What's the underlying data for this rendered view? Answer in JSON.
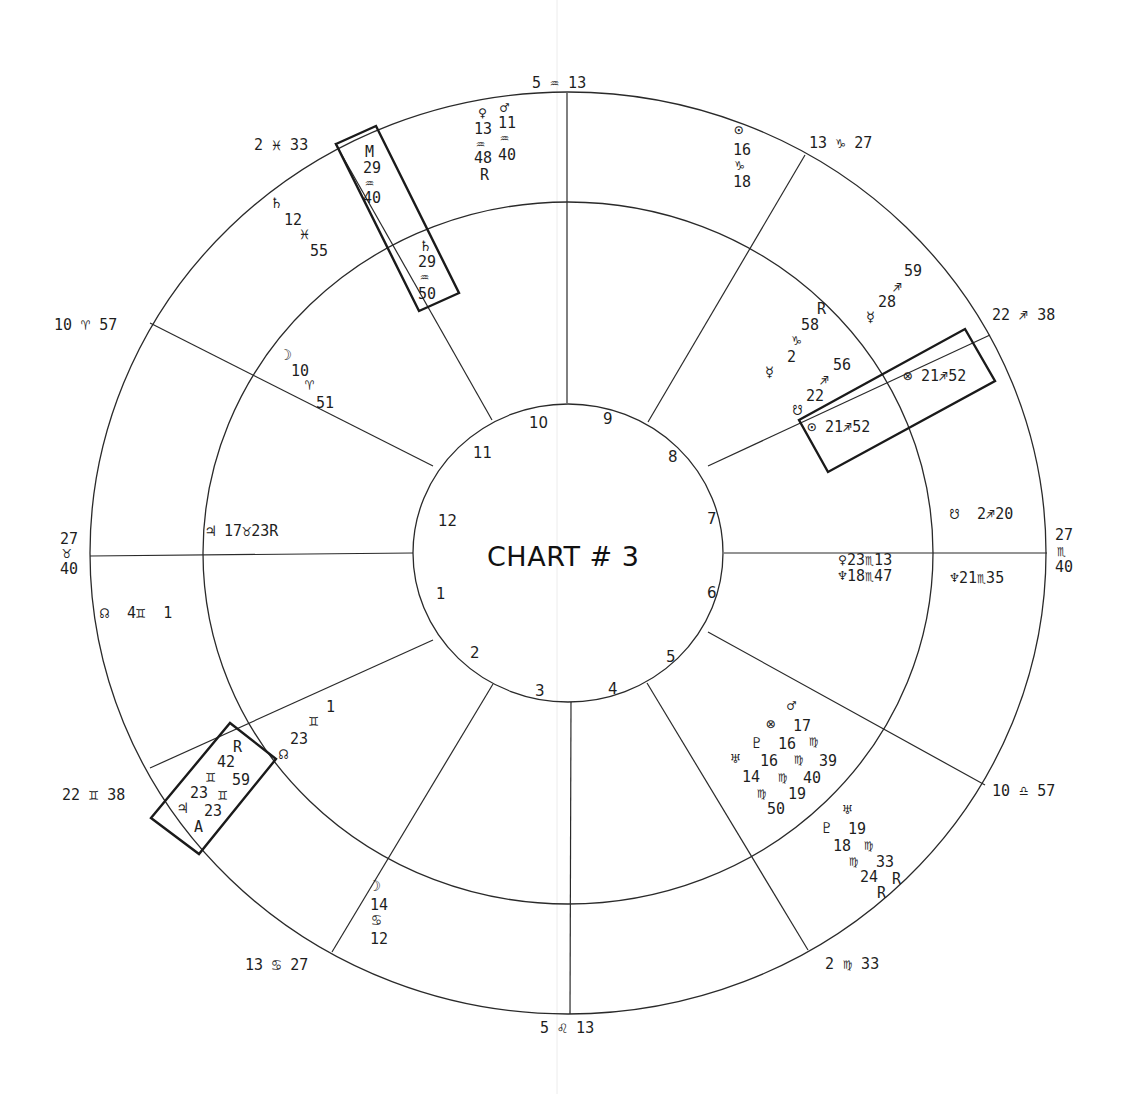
{
  "title": "CHART # 3",
  "geometry": {
    "center": [
      568,
      553
    ],
    "outer": [
      478,
      461
    ],
    "middle": [
      365,
      351
    ],
    "inner": [
      155,
      149
    ]
  },
  "cusp_lines": [
    {
      "from": [
        567,
        403
      ],
      "to": [
        567,
        93
      ]
    },
    {
      "from": [
        648,
        422
      ],
      "to": [
        805,
        155
      ]
    },
    {
      "from": [
        708,
        466
      ],
      "to": [
        990,
        335
      ]
    },
    {
      "from": [
        724,
        553
      ],
      "to": [
        1047,
        553
      ]
    },
    {
      "from": [
        708,
        632
      ],
      "to": [
        985,
        785
      ]
    },
    {
      "from": [
        647,
        683
      ],
      "to": [
        808,
        950
      ]
    },
    {
      "from": [
        571,
        702
      ],
      "to": [
        570,
        1014
      ]
    },
    {
      "from": [
        493,
        684
      ],
      "to": [
        332,
        952
      ]
    },
    {
      "from": [
        433,
        640
      ],
      "to": [
        150,
        768
      ]
    },
    {
      "from": [
        413,
        553
      ],
      "to": [
        90,
        556
      ]
    },
    {
      "from": [
        433,
        466
      ],
      "to": [
        150,
        323
      ]
    },
    {
      "from": [
        492,
        420
      ],
      "to": [
        335,
        143
      ]
    }
  ],
  "house_numbers": [
    {
      "label": "1",
      "x": 436,
      "y": 599
    },
    {
      "label": "2",
      "x": 470,
      "y": 658
    },
    {
      "label": "3",
      "x": 535,
      "y": 696
    },
    {
      "label": "4",
      "x": 608,
      "y": 694
    },
    {
      "label": "5",
      "x": 666,
      "y": 662
    },
    {
      "label": "6",
      "x": 707,
      "y": 598
    },
    {
      "label": "7",
      "x": 707,
      "y": 524
    },
    {
      "label": "8",
      "x": 668,
      "y": 462
    },
    {
      "label": "9",
      "x": 603,
      "y": 424
    },
    {
      "label": "10",
      "x": 529,
      "y": 428
    },
    {
      "label": "11",
      "x": 473,
      "y": 458
    },
    {
      "label": "12",
      "x": 438,
      "y": 526
    }
  ],
  "cusp_labels": [
    {
      "name": "cusp-mc",
      "text": "5 ♒ 13",
      "x": 532,
      "y": 88
    },
    {
      "name": "cusp-11",
      "text": "13 ♑ 27",
      "x": 809,
      "y": 148
    },
    {
      "name": "cusp-12",
      "text": "22 ♐ 38",
      "x": 992,
      "y": 320
    },
    {
      "name": "cusp-asc-deg",
      "text": "27",
      "x": 1055,
      "y": 540
    },
    {
      "name": "cusp-asc-sign",
      "text": "♏",
      "x": 1057,
      "y": 556
    },
    {
      "name": "cusp-asc-min",
      "text": "40",
      "x": 1055,
      "y": 572
    },
    {
      "name": "cusp-2",
      "text": "10 ♎ 57",
      "x": 992,
      "y": 796
    },
    {
      "name": "cusp-3",
      "text": "2 ♍ 33",
      "x": 825,
      "y": 969
    },
    {
      "name": "cusp-ic",
      "text": "5 ♌ 13",
      "x": 540,
      "y": 1033
    },
    {
      "name": "cusp-5",
      "text": "13 ♋ 27",
      "x": 245,
      "y": 970
    },
    {
      "name": "cusp-6",
      "text": "22 ♊ 38",
      "x": 62,
      "y": 800
    },
    {
      "name": "cusp-desc-deg",
      "text": "27",
      "x": 60,
      "y": 544
    },
    {
      "name": "cusp-desc-sign",
      "text": "♉",
      "x": 62,
      "y": 558
    },
    {
      "name": "cusp-desc-min",
      "text": "40",
      "x": 60,
      "y": 574
    },
    {
      "name": "cusp-8",
      "text": "10 ♈ 57",
      "x": 54,
      "y": 330
    },
    {
      "name": "cusp-9",
      "text": "2 ♓ 33",
      "x": 254,
      "y": 150
    }
  ],
  "planet_labels": [
    {
      "name": "venus-glyph",
      "text": "♀",
      "x": 478,
      "y": 118
    },
    {
      "name": "venus-deg",
      "text": "13",
      "x": 474,
      "y": 134
    },
    {
      "name": "venus-sign",
      "text": "♒",
      "x": 476,
      "y": 149
    },
    {
      "name": "venus-min",
      "text": "48",
      "x": 474,
      "y": 163
    },
    {
      "name": "venus-retro",
      "text": "R",
      "x": 480,
      "y": 180
    },
    {
      "name": "mars-glyph",
      "text": "♂",
      "x": 500,
      "y": 113
    },
    {
      "name": "mars-deg",
      "text": "11",
      "x": 498,
      "y": 128
    },
    {
      "name": "mars-sign",
      "text": "♒",
      "x": 500,
      "y": 143
    },
    {
      "name": "mars-min",
      "text": "40",
      "x": 498,
      "y": 160
    },
    {
      "name": "mc-point-glyph",
      "text": "M",
      "x": 365,
      "y": 157
    },
    {
      "name": "mc-point-deg",
      "text": "29",
      "x": 363,
      "y": 173
    },
    {
      "name": "mc-point-sign",
      "text": "♒",
      "x": 365,
      "y": 188
    },
    {
      "name": "mc-point-min",
      "text": "40",
      "x": 363,
      "y": 203
    },
    {
      "name": "saturn-inner-glyph",
      "text": "♄",
      "x": 421,
      "y": 251
    },
    {
      "name": "saturn-inner-deg",
      "text": "29",
      "x": 418,
      "y": 267
    },
    {
      "name": "saturn-inner-sign",
      "text": "♒",
      "x": 420,
      "y": 282
    },
    {
      "name": "saturn-inner-min",
      "text": "50",
      "x": 418,
      "y": 299
    },
    {
      "name": "saturn-outer-glyph",
      "text": "♄",
      "x": 272,
      "y": 208
    },
    {
      "name": "saturn-outer-deg",
      "text": "12",
      "x": 284,
      "y": 225
    },
    {
      "name": "saturn-outer-sign",
      "text": "♓",
      "x": 300,
      "y": 239
    },
    {
      "name": "saturn-outer-min",
      "text": "55",
      "x": 310,
      "y": 256
    },
    {
      "name": "sun-outer-glyph",
      "text": "⊙",
      "x": 734,
      "y": 135
    },
    {
      "name": "sun-outer-deg",
      "text": "16",
      "x": 733,
      "y": 155
    },
    {
      "name": "sun-outer-sign",
      "text": "♑",
      "x": 735,
      "y": 170
    },
    {
      "name": "sun-outer-min",
      "text": "18",
      "x": 733,
      "y": 187
    },
    {
      "name": "mercury-outer-min",
      "text": "59",
      "x": 904,
      "y": 276
    },
    {
      "name": "mercury-outer-sign",
      "text": "♐",
      "x": 893,
      "y": 292
    },
    {
      "name": "mercury-outer-deg",
      "text": "28",
      "x": 878,
      "y": 307
    },
    {
      "name": "mercury-outer-glyph",
      "text": "☿",
      "x": 866,
      "y": 322
    },
    {
      "name": "mercury-inner-retro",
      "text": "R",
      "x": 817,
      "y": 314
    },
    {
      "name": "mercury-inner-min",
      "text": "58",
      "x": 801,
      "y": 330
    },
    {
      "name": "mercury-inner-sign",
      "text": "♑",
      "x": 792,
      "y": 345
    },
    {
      "name": "mercury-inner-deg",
      "text": "2",
      "x": 787,
      "y": 362
    },
    {
      "name": "mercury-inner-glyph",
      "text": "☿",
      "x": 765,
      "y": 377
    },
    {
      "name": "node-inner-min",
      "text": "56",
      "x": 833,
      "y": 370
    },
    {
      "name": "node-inner-sign",
      "text": "♐",
      "x": 820,
      "y": 385
    },
    {
      "name": "node-inner-deg",
      "text": "22",
      "x": 806,
      "y": 401
    },
    {
      "name": "node-inner-glyph",
      "text": "☋",
      "x": 793,
      "y": 415
    },
    {
      "name": "part-fortune-outer",
      "text": "⊗ 21♐52",
      "x": 903,
      "y": 381
    },
    {
      "name": "sun-inner",
      "text": "⊙ 21♐52",
      "x": 807,
      "y": 432
    },
    {
      "name": "south-node-outer",
      "text": "☋  2♐20",
      "x": 950,
      "y": 519
    },
    {
      "name": "venus-inner",
      "text": "♀23♏13",
      "x": 838,
      "y": 565
    },
    {
      "name": "neptune-inner",
      "text": "♆18♏47",
      "x": 838,
      "y": 581
    },
    {
      "name": "neptune-outer",
      "text": "♆21♏35",
      "x": 950,
      "y": 583
    },
    {
      "name": "moon-inner-glyph",
      "text": "☽",
      "x": 283,
      "y": 360
    },
    {
      "name": "moon-inner-deg",
      "text": "10",
      "x": 291,
      "y": 376
    },
    {
      "name": "moon-inner-sign",
      "text": "♈",
      "x": 305,
      "y": 390
    },
    {
      "name": "moon-inner-min",
      "text": "51",
      "x": 316,
      "y": 408
    },
    {
      "name": "jupiter-inner",
      "text": "♃ 17♉23R",
      "x": 206,
      "y": 536
    },
    {
      "name": "north-node-outer",
      "text": "☊  4♊  1",
      "x": 100,
      "y": 618
    },
    {
      "name": "north-node-inner-min",
      "text": "1",
      "x": 326,
      "y": 712
    },
    {
      "name": "north-node-inner-sign",
      "text": "♊",
      "x": 309,
      "y": 726
    },
    {
      "name": "north-node-inner-deg",
      "text": "23",
      "x": 290,
      "y": 744
    },
    {
      "name": "north-node-inner-glyph",
      "text": "☊",
      "x": 279,
      "y": 759
    },
    {
      "name": "jupiter-outer-retro",
      "text": "R",
      "x": 233,
      "y": 752
    },
    {
      "name": "jupiter-outer-min",
      "text": "42",
      "x": 217,
      "y": 767
    },
    {
      "name": "jupiter-outer-sign",
      "text": "♊",
      "x": 206,
      "y": 782
    },
    {
      "name": "jupiter-outer-min2",
      "text": "59",
      "x": 232,
      "y": 785
    },
    {
      "name": "asc-point-deg",
      "text": "23",
      "x": 190,
      "y": 798
    },
    {
      "name": "asc-point-sign",
      "text": "♊",
      "x": 218,
      "y": 800
    },
    {
      "name": "jupiter-outer-glyph",
      "text": "♃",
      "x": 178,
      "y": 813
    },
    {
      "name": "jupiter-outer-deg",
      "text": "23",
      "x": 204,
      "y": 816
    },
    {
      "name": "asc-point-glyph",
      "text": "A",
      "x": 194,
      "y": 832
    },
    {
      "name": "moon-outer-glyph",
      "text": "☽",
      "x": 372,
      "y": 891
    },
    {
      "name": "moon-outer-deg",
      "text": "14",
      "x": 370,
      "y": 910
    },
    {
      "name": "moon-outer-sign",
      "text": "♋",
      "x": 372,
      "y": 925
    },
    {
      "name": "moon-outer-min",
      "text": "12",
      "x": 370,
      "y": 944
    },
    {
      "name": "mars-lower-glyph",
      "text": "♂",
      "x": 787,
      "y": 711
    },
    {
      "name": "fortune-lower-glyph",
      "text": "⊗",
      "x": 766,
      "y": 729
    },
    {
      "name": "mars-lower-deg",
      "text": "17",
      "x": 793,
      "y": 731
    },
    {
      "name": "pluto-lower-glyph",
      "text": "♇",
      "x": 752,
      "y": 748
    },
    {
      "name": "pluto-lower-deg",
      "text": "16",
      "x": 778,
      "y": 749
    },
    {
      "name": "mars-lower-sign",
      "text": "♍",
      "x": 809,
      "y": 746
    },
    {
      "name": "uranus-lower-glyph",
      "text": "♅",
      "x": 731,
      "y": 764
    },
    {
      "name": "uranus-lower-deg",
      "text": "16",
      "x": 760,
      "y": 766
    },
    {
      "name": "pluto-lower-sign",
      "text": "♍",
      "x": 794,
      "y": 764
    },
    {
      "name": "mars-lower-min",
      "text": "39",
      "x": 819,
      "y": 766
    },
    {
      "name": "uranus-lower-min-row",
      "text": "14",
      "x": 742,
      "y": 782
    },
    {
      "name": "uranus-lower-sign",
      "text": "♍",
      "x": 778,
      "y": 782
    },
    {
      "name": "pluto-lower-min",
      "text": "40",
      "x": 803,
      "y": 783
    },
    {
      "name": "fortune-lower-sign",
      "text": "♍",
      "x": 757,
      "y": 798
    },
    {
      "name": "fortune-lower-deg",
      "text": "19",
      "x": 788,
      "y": 799
    },
    {
      "name": "fortune-lower-min",
      "text": "50",
      "x": 767,
      "y": 814
    },
    {
      "name": "uranus-outer-glyph",
      "text": "♅",
      "x": 843,
      "y": 815
    },
    {
      "name": "pluto-outer-glyph",
      "text": "♇",
      "x": 822,
      "y": 833
    },
    {
      "name": "uranus-outer-deg",
      "text": "19",
      "x": 848,
      "y": 834
    },
    {
      "name": "pluto-outer-deg",
      "text": "18",
      "x": 833,
      "y": 851
    },
    {
      "name": "uranus-outer-sign",
      "text": "♍",
      "x": 864,
      "y": 850
    },
    {
      "name": "pluto-outer-sign",
      "text": "♍",
      "x": 849,
      "y": 866
    },
    {
      "name": "uranus-outer-min",
      "text": "33",
      "x": 876,
      "y": 867
    },
    {
      "name": "pluto-outer-min",
      "text": "24",
      "x": 860,
      "y": 882
    },
    {
      "name": "uranus-outer-retro",
      "text": "R",
      "x": 892,
      "y": 884
    },
    {
      "name": "pluto-outer-retro",
      "text": "R",
      "x": 877,
      "y": 898
    }
  ],
  "boxes": [
    {
      "name": "saturn-mc-box",
      "points": "336,144 376,126 459,293 419,311"
    },
    {
      "name": "sun-fortune-box",
      "points": "799,420 965,329 995,381 828,472"
    },
    {
      "name": "jupiter-asc-box",
      "points": "151,818 230,723 276,759 199,854"
    }
  ]
}
